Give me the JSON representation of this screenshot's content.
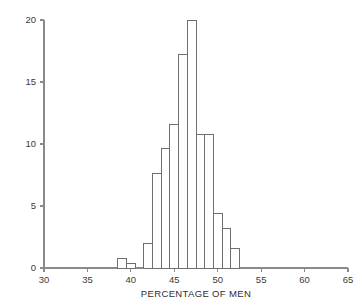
{
  "chart_data": {
    "type": "bar",
    "title": "",
    "subtitle": "",
    "xlabel": "PERCENTAGE OF MEN",
    "ylabel": "",
    "xlim": [
      30,
      65
    ],
    "ylim": [
      0,
      20
    ],
    "xticks": [
      30,
      35,
      40,
      45,
      50,
      55,
      60,
      65
    ],
    "xtick_labels": [
      "30",
      "35",
      "40",
      "45",
      "50",
      "55",
      "60",
      "65"
    ],
    "yticks": [
      0,
      5,
      10,
      15,
      20
    ],
    "ytick_labels": [
      "0",
      "5",
      "10",
      "15",
      "20"
    ],
    "minor_xtick_step": 1,
    "grid": false,
    "legend": null,
    "bin_width": 1,
    "bin_starts": [
      38.5,
      39.5,
      41.5,
      42.5,
      43.5,
      44.5,
      45.5,
      46.5,
      47.5,
      48.5,
      49.5,
      50.5,
      51.5
    ],
    "categories": [
      "38.5-39.5",
      "39.5-40.5",
      "41.5-42.5",
      "42.5-43.5",
      "43.5-44.5",
      "44.5-45.5",
      "45.5-46.5",
      "46.5-47.5",
      "47.5-48.5",
      "48.5-49.5",
      "49.5-50.5",
      "50.5-51.5",
      "51.5-52.5"
    ],
    "values": [
      0.8,
      0.4,
      2.0,
      7.6,
      9.6,
      11.6,
      17.2,
      20.0,
      10.8,
      10.8,
      4.4,
      3.2,
      1.6
    ],
    "bar_fill": "#ffffff",
    "bar_stroke": "#6f6f6f",
    "axis_color": "#8a8a8a",
    "text_color": "#3a3a3a"
  }
}
